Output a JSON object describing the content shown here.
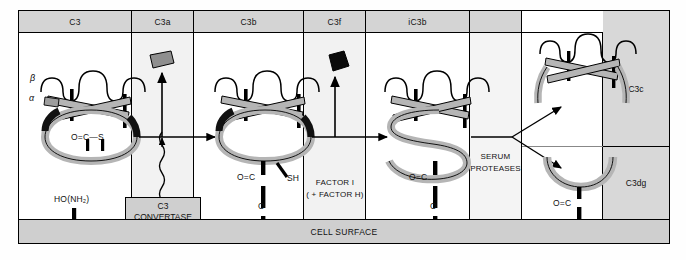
{
  "figure": {
    "cell_surface_label": "CELL SURFACE"
  },
  "columns": [
    {
      "id": "c3",
      "label": "C3"
    },
    {
      "id": "c3a",
      "label": "C3a"
    },
    {
      "id": "c3b",
      "label": "C3b"
    },
    {
      "id": "c3f",
      "label": "C3f"
    },
    {
      "id": "ic3b",
      "label": "iC3b"
    },
    {
      "id": "blank",
      "label": ""
    },
    {
      "id": "prod",
      "label": ""
    }
  ],
  "right_labels": [
    {
      "id": "c3c",
      "label": "C3c"
    },
    {
      "id": "c3dg",
      "label": "C3dg"
    }
  ],
  "annotations": {
    "beta_chain": "β",
    "alpha_chain": "α",
    "thioester_c3": "O=C—S",
    "acceptor": "HO(NH₂)",
    "convertase": "C3\nCONVERTASE",
    "convertase_line1": "C3",
    "convertase_line2": "CONVERTASE",
    "thioester_bond_carbonyl": "O=C",
    "thioester_bond_oxygen": "O",
    "free_thiol": "SH",
    "factor_i_line1": "FACTOR I",
    "factor_i_line2": "( + FACTOR H)",
    "serum_proteases_line1": "SERUM",
    "serum_proteases_line2": "PROTEASES"
  },
  "colors": {
    "header_gray": "#d4d4d4",
    "panel_gray": "#f2f2f2",
    "molecule_gray": "#b5b5b5",
    "cell_surface_gray": "#cfcfcf",
    "outline": "#000000"
  }
}
